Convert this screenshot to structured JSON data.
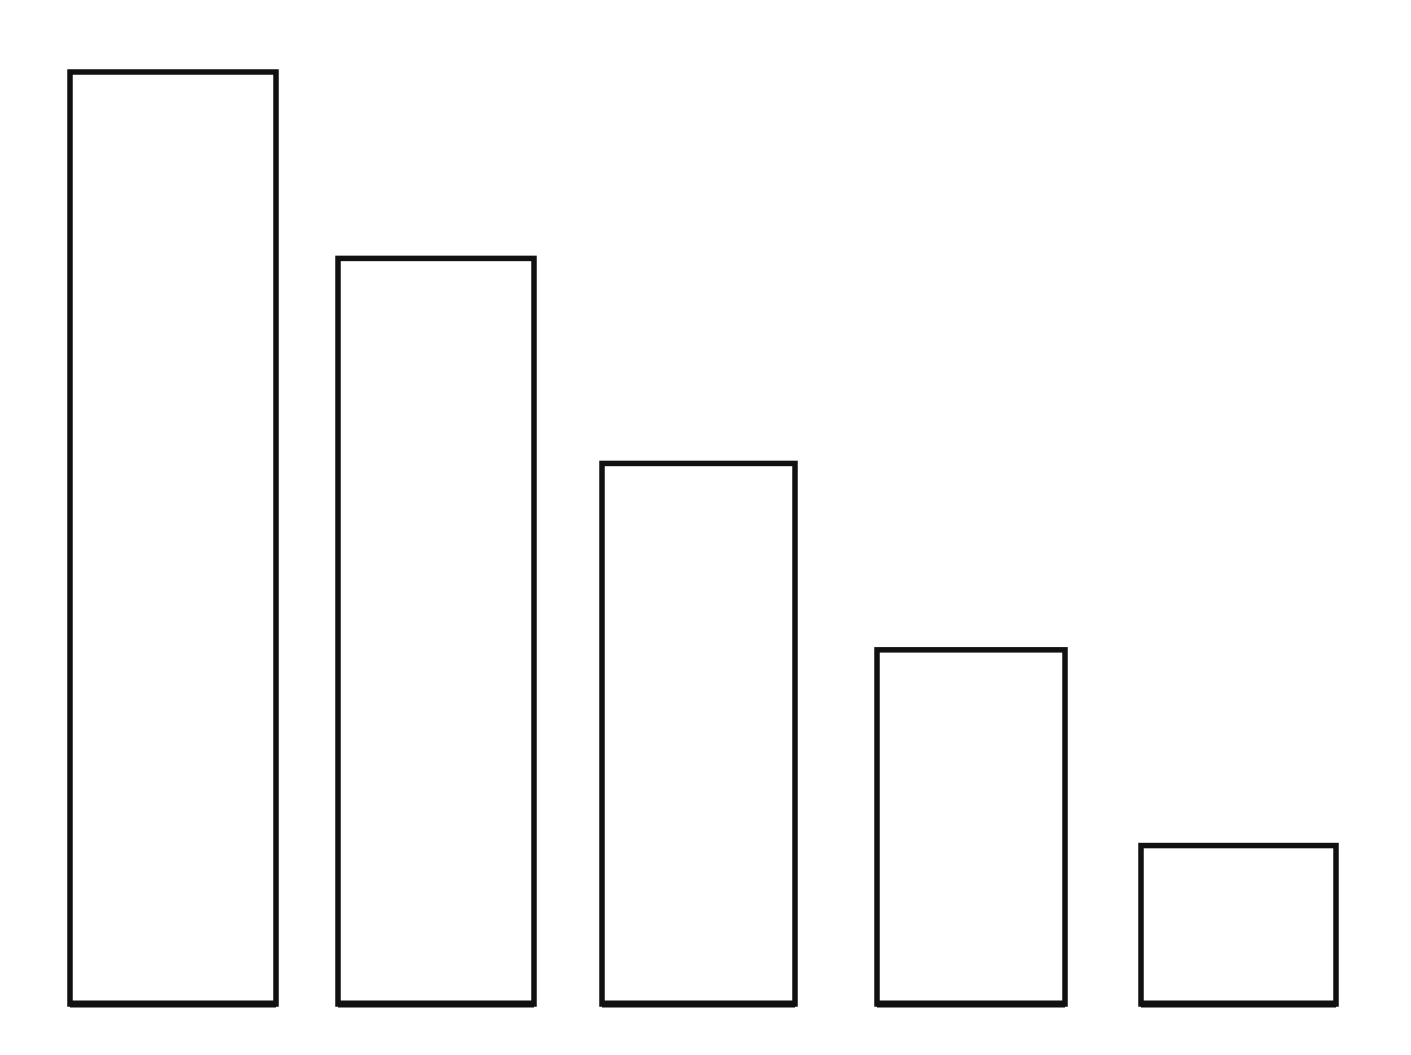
{
  "chart_data": {
    "type": "bar",
    "title": "",
    "xlabel": "",
    "ylabel": "",
    "categories": [
      "",
      "",
      "",
      "",
      ""
    ],
    "values": [
      100,
      80,
      58,
      38,
      17
    ],
    "ylim": [
      0,
      100
    ],
    "grid": false,
    "legend": null,
    "style": "hand-drawn outline bars, no axes, no labels",
    "colors": {
      "stroke": "#111111",
      "fill": "#ffffff",
      "background": "#ffffff"
    }
  },
  "layout": {
    "baseline_y": 1004,
    "plot_top_y": 72,
    "bars": [
      {
        "x_left": 70,
        "x_right": 276
      },
      {
        "x_left": 338,
        "x_right": 534
      },
      {
        "x_left": 602,
        "x_right": 795
      },
      {
        "x_left": 877,
        "x_right": 1065
      },
      {
        "x_left": 1141,
        "x_right": 1336
      }
    ]
  }
}
